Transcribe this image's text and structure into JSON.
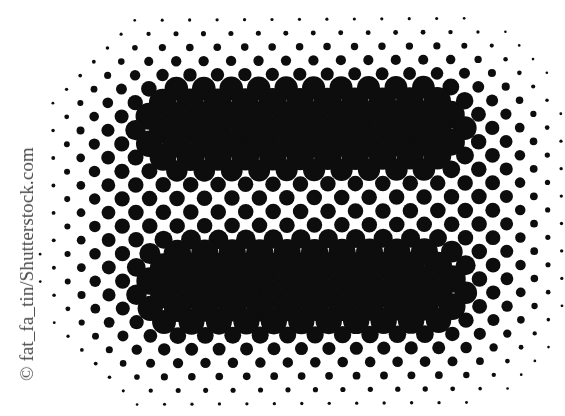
{
  "image": {
    "width": 565,
    "height": 416,
    "background": "#ffffff",
    "subject": "Halftone dot pattern forming a rounded rectangle with two dark horizontal bars"
  },
  "credit": {
    "text": "© fat_fa_tin/Shutterstock.com",
    "color": "#4a4a4a"
  },
  "halftone": {
    "dot_color": "#0d0d0d",
    "lattice": {
      "origin_x": 107.3,
      "origin_y": 20.5,
      "spacing_x": 27.45,
      "row_spacing_y": 13.72,
      "row_offset_x": 13.72,
      "rotation_deg": -0.35,
      "rows": 30,
      "cols": 22
    },
    "max_diameter": 27.5,
    "shape": {
      "outer": {
        "cx": 305,
        "cy": 212,
        "half_w": 270,
        "half_h": 205,
        "corner_radius": 150,
        "falloff": 95,
        "base_diameter": 15.5,
        "min_diameter": 2.6
      },
      "bars": [
        {
          "name": "upper-bar",
          "x1": 150,
          "x2": 455,
          "y1": 98,
          "y2": 158,
          "radius": 30,
          "falloff": 26,
          "diameter": 27.5
        },
        {
          "name": "lower-bar",
          "x1": 150,
          "x2": 455,
          "y1": 255,
          "y2": 316,
          "radius": 30,
          "falloff": 26,
          "diameter": 27.5
        }
      ]
    }
  }
}
